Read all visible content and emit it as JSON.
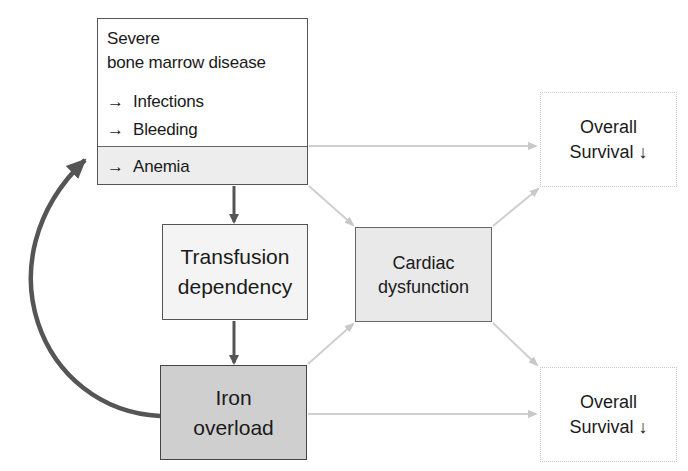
{
  "diagram": {
    "nodes": {
      "disease": {
        "title_line1": "Severe",
        "title_line2": "bone marrow disease",
        "items": [
          {
            "arrow": "→",
            "label": "Infections"
          },
          {
            "arrow": "→",
            "label": "Bleeding"
          },
          {
            "arrow": "→",
            "label": "Anemia"
          }
        ]
      },
      "transfusion": {
        "line1": "Transfusion",
        "line2": "dependency"
      },
      "cardiac": {
        "line1": "Cardiac",
        "line2": "dysfunction"
      },
      "iron": {
        "line1": "Iron",
        "line2": "overload"
      },
      "survival_top": {
        "line1": "Overall",
        "line2": "Survival ↓"
      },
      "survival_bottom": {
        "line1": "Overall",
        "line2": "Survival ↓"
      }
    },
    "edges": [
      {
        "from": "Anemia",
        "to": "Transfusion dependency",
        "style": "dark"
      },
      {
        "from": "Transfusion dependency",
        "to": "Iron overload",
        "style": "dark"
      },
      {
        "from": "Iron overload",
        "to": "Anemia",
        "style": "dark-curved"
      },
      {
        "from": "Anemia",
        "to": "Overall Survival (top)",
        "style": "light"
      },
      {
        "from": "Anemia",
        "to": "Cardiac dysfunction",
        "style": "light"
      },
      {
        "from": "Cardiac dysfunction",
        "to": "Overall Survival (top)",
        "style": "light"
      },
      {
        "from": "Iron overload",
        "to": "Cardiac dysfunction",
        "style": "light"
      },
      {
        "from": "Cardiac dysfunction",
        "to": "Overall Survival (bottom)",
        "style": "light"
      },
      {
        "from": "Iron overload",
        "to": "Overall Survival (bottom)",
        "style": "light"
      }
    ],
    "colors": {
      "dark_arrow": "#555555",
      "light_arrow": "#cfcfcf",
      "iron_fill": "#cfcfcf",
      "cardiac_fill": "#e9e9e9",
      "anemia_fill": "#ededed"
    }
  }
}
